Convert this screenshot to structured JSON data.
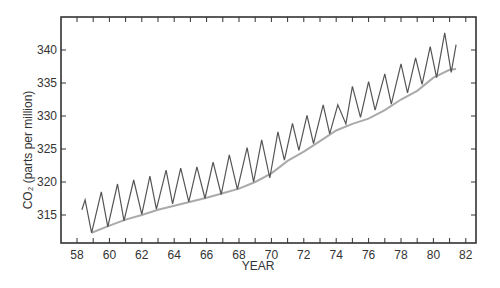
{
  "chart_data": {
    "type": "line",
    "title": "",
    "xlabel": "YEAR",
    "ylabel": "CO₂ (parts per million)",
    "xlim": [
      57.5,
      82.6
    ],
    "ylim": [
      310.2,
      345.0
    ],
    "grid": false,
    "legend": null,
    "x_ticks": [
      58,
      60,
      62,
      64,
      66,
      68,
      70,
      72,
      74,
      76,
      78,
      80,
      82
    ],
    "x_minor_ticks": [
      59,
      61,
      63,
      65,
      67,
      69,
      71,
      73,
      75,
      77,
      79,
      81
    ],
    "y_ticks": [
      315,
      320,
      325,
      330,
      335,
      340
    ],
    "series": [
      {
        "name": "Monthly CO2 (seasonal cycle)",
        "color": "#555555",
        "x": [
          58.3,
          58.5,
          58.9,
          59.5,
          59.9,
          60.5,
          60.9,
          61.5,
          62.0,
          62.5,
          62.9,
          63.5,
          63.9,
          64.4,
          64.9,
          65.4,
          65.9,
          66.4,
          66.9,
          67.4,
          67.9,
          68.5,
          68.9,
          69.4,
          69.9,
          70.4,
          70.8,
          71.3,
          71.7,
          72.2,
          72.6,
          73.2,
          73.6,
          74.1,
          74.6,
          75.0,
          75.5,
          76.0,
          76.4,
          77.0,
          77.4,
          78.0,
          78.4,
          78.9,
          79.3,
          79.8,
          80.2,
          80.7,
          81.1,
          81.4
        ],
        "y": [
          315.8,
          317.3,
          312.3,
          318.5,
          313.2,
          319.7,
          314.1,
          320.3,
          315.1,
          320.9,
          315.9,
          321.8,
          316.7,
          322.1,
          317.0,
          322.3,
          317.5,
          323.0,
          318.1,
          324.1,
          318.9,
          325.2,
          320.0,
          326.4,
          320.6,
          327.6,
          323.3,
          328.9,
          324.8,
          330.1,
          325.8,
          331.7,
          327.3,
          331.7,
          328.8,
          334.5,
          329.8,
          335.2,
          330.9,
          336.4,
          331.8,
          337.9,
          333.5,
          338.8,
          334.8,
          340.5,
          335.8,
          342.6,
          336.6,
          340.8
        ]
      },
      {
        "name": "Smoothed trend",
        "color": "#aaaaaa",
        "x": [
          58.9,
          60.0,
          61.0,
          62.0,
          63.0,
          64.0,
          65.0,
          66.0,
          67.0,
          68.0,
          69.0,
          70.0,
          71.0,
          72.0,
          73.0,
          74.0,
          75.0,
          76.0,
          77.0,
          78.0,
          79.0,
          80.0,
          81.0,
          81.4
        ],
        "y": [
          312.3,
          313.4,
          314.3,
          315.0,
          315.8,
          316.4,
          317.0,
          317.6,
          318.3,
          319.0,
          320.0,
          321.3,
          323.2,
          324.6,
          326.2,
          327.8,
          328.8,
          329.6,
          330.9,
          332.5,
          333.8,
          335.8,
          337.0,
          337.1
        ]
      }
    ]
  }
}
